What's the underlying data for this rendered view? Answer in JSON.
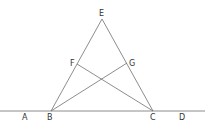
{
  "diagram": {
    "type": "geometry-figure",
    "line_color": "#707070",
    "label_color": "#333333",
    "points": {
      "A": {
        "label": "A",
        "x": 25,
        "y": 111,
        "label_x": 22,
        "label_y": 120
      },
      "B": {
        "label": "B",
        "x": 51,
        "y": 111,
        "label_x": 47,
        "label_y": 120
      },
      "C": {
        "label": "C",
        "x": 153,
        "y": 111,
        "label_x": 150,
        "label_y": 120
      },
      "D": {
        "label": "D",
        "x": 182,
        "y": 111,
        "label_x": 179,
        "label_y": 120
      },
      "E": {
        "label": "E",
        "x": 102,
        "y": 19,
        "label_x": 99,
        "label_y": 16
      },
      "F": {
        "label": "F",
        "x": 77,
        "y": 64,
        "label_x": 70,
        "label_y": 66
      },
      "G": {
        "label": "G",
        "x": 127,
        "y": 63,
        "label_x": 129,
        "label_y": 66
      }
    },
    "segments": [
      {
        "name": "line-AD",
        "from": "A",
        "to": "D",
        "x1": 0,
        "y1": 111,
        "x2": 205,
        "y2": 111
      },
      {
        "name": "segment-BE",
        "from": "B",
        "to": "E",
        "x1": 51,
        "y1": 111,
        "x2": 102,
        "y2": 19
      },
      {
        "name": "segment-CE",
        "from": "C",
        "to": "E",
        "x1": 153,
        "y1": 111,
        "x2": 102,
        "y2": 19
      },
      {
        "name": "segment-BG",
        "from": "B",
        "to": "G",
        "x1": 51,
        "y1": 111,
        "x2": 127,
        "y2": 63
      },
      {
        "name": "segment-CF",
        "from": "C",
        "to": "F",
        "x1": 153,
        "y1": 111,
        "x2": 77,
        "y2": 64
      }
    ]
  }
}
